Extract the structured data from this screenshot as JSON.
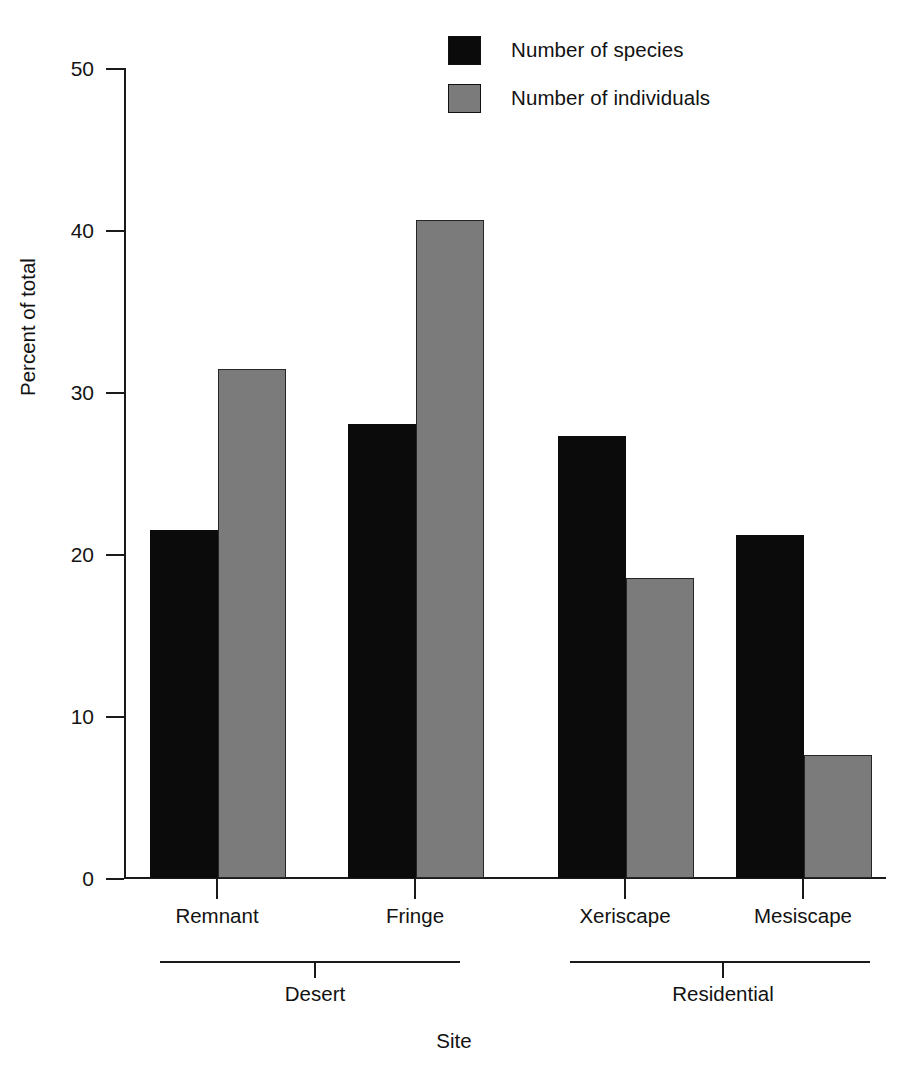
{
  "chart_data": {
    "type": "bar",
    "title": "",
    "subtitle": "",
    "xlabel": "Site",
    "ylabel": "Percent of total",
    "categories": [
      "Remnant",
      "Fringe",
      "Xeriscape",
      "Mesiscape"
    ],
    "groups": [
      {
        "label": "Desert",
        "categories": [
          "Remnant",
          "Fringe"
        ]
      },
      {
        "label": "Residential",
        "categories": [
          "Xeriscape",
          "Mesiscape"
        ]
      }
    ],
    "series": [
      {
        "name": "Number of species",
        "color": "#0b0b0b",
        "values": [
          21.5,
          28.0,
          27.3,
          21.2
        ]
      },
      {
        "name": "Number of individuals",
        "color": "#7b7b7b",
        "values": [
          31.4,
          40.6,
          18.5,
          7.6
        ]
      }
    ],
    "ylim": [
      0,
      50
    ],
    "yticks": [
      0,
      10,
      20,
      30,
      40,
      50
    ],
    "ytick_labels": [
      "0",
      "10",
      "20",
      "30",
      "40",
      "50"
    ],
    "grid": false,
    "legend_position": "top-center"
  },
  "legend": {
    "items": [
      {
        "label": "Number of species"
      },
      {
        "label": "Number of individuals"
      }
    ]
  },
  "axes": {
    "y_title": "Percent of total",
    "x_title": "Site",
    "y_ticks": [
      {
        "label": "50"
      },
      {
        "label": "40"
      },
      {
        "label": "30"
      },
      {
        "label": "20"
      },
      {
        "label": "10"
      },
      {
        "label": "0"
      }
    ],
    "x_ticks": [
      {
        "label": "Remnant"
      },
      {
        "label": "Fringe"
      },
      {
        "label": "Xeriscape"
      },
      {
        "label": "Mesiscape"
      }
    ],
    "groups": [
      {
        "label": "Desert"
      },
      {
        "label": "Residential"
      }
    ]
  }
}
